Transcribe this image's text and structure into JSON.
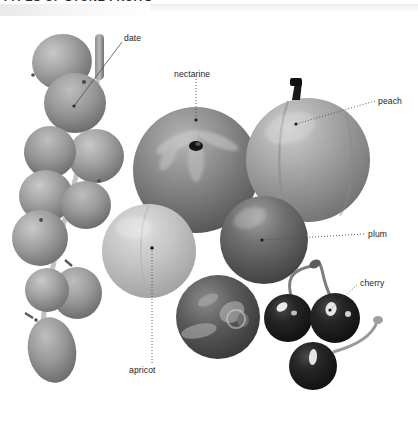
{
  "figure": {
    "heading": "TYPES OF STONE FRUITS",
    "palette": {
      "background": "#ffffff",
      "text": "#1c1c1c",
      "leader_line": "#4d4d4d",
      "date_fill": "#9a9a9a",
      "date_shade": "#6e6e6e",
      "nectarine_fill": "#8a8a8a",
      "nectarine_shade": "#5f5f5f",
      "peach_fill": "#a3a3a3",
      "peach_shade": "#767676",
      "apricot_fill": "#c2c2c2",
      "apricot_shade": "#a0a0a0",
      "plum_fill": "#6b6b6b",
      "plum_shade": "#454545",
      "cherry_fill": "#1e1e1e",
      "cherry_highlight": "#e8e8e8",
      "stem": "#6a6a6a"
    },
    "style": "grayscale halftone photographic illustration",
    "labels": [
      {
        "id": "date",
        "text": "date",
        "text_x": 124,
        "text_y": 33,
        "leader": {
          "x1": 122,
          "y1": 42,
          "x2": 74,
          "y2": 106
        },
        "leader_style": "solid-thin"
      },
      {
        "id": "nectarine",
        "text": "nectarine",
        "text_x": 174,
        "text_y": 69,
        "leader": {
          "x1": 196,
          "y1": 79,
          "x2": 196,
          "y2": 120
        },
        "leader_style": "dotted"
      },
      {
        "id": "peach",
        "text": "peach",
        "text_x": 378,
        "text_y": 96,
        "leader": {
          "x1": 375,
          "y1": 101,
          "x2": 296,
          "y2": 124
        },
        "leader_style": "dotted"
      },
      {
        "id": "plum",
        "text": "plum",
        "text_x": 368,
        "text_y": 229,
        "leader": {
          "x1": 364,
          "y1": 234,
          "x2": 262,
          "y2": 240
        },
        "leader_style": "dotted"
      },
      {
        "id": "cherry",
        "text": "cherry",
        "text_x": 360,
        "text_y": 278,
        "leader": {
          "x1": 357,
          "y1": 285,
          "x2": 330,
          "y2": 310
        },
        "leader_style": "dotted"
      },
      {
        "id": "apricot",
        "text": "apricot",
        "text_x": 129,
        "text_y": 365,
        "leader": {
          "x1": 152,
          "y1": 363,
          "x2": 152,
          "y2": 248
        },
        "leader_style": "dotted"
      }
    ],
    "fruits": [
      {
        "id": "date-cluster",
        "name": "date",
        "count": 9,
        "note": "cluster of oval dates on a branch, upper-left descending to lower-left"
      },
      {
        "id": "nectarine",
        "name": "nectarine",
        "count": 1,
        "note": "large round fruit, centre, dark stellate stem depression at top"
      },
      {
        "id": "peach",
        "name": "peach",
        "count": 1,
        "note": "large round fruit, upper-right, short dark stem at top with suture groove"
      },
      {
        "id": "apricot",
        "name": "apricot",
        "count": 1,
        "note": "pale round fruit, centre-left lower"
      },
      {
        "id": "plum-round",
        "name": "plum",
        "count": 1,
        "note": "dark round plum, right of centre"
      },
      {
        "id": "plum-mottled",
        "name": "plum",
        "count": 1,
        "note": "mottled dark plum, lower centre"
      },
      {
        "id": "cherries",
        "name": "cherry",
        "count": 3,
        "note": "three dark cherries with long curved stems, lower-right"
      }
    ]
  }
}
